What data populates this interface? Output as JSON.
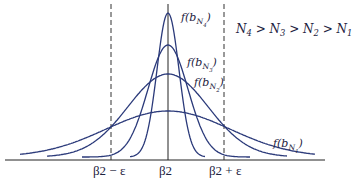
{
  "figure": {
    "relation_text": "N4 > N3 > N2 > N1",
    "colors": {
      "curve": "#2b3a7a",
      "axis": "#222222",
      "dashed": "#333333",
      "text": "#1d2240"
    },
    "axis": {
      "ticks": [
        {
          "id": "minus",
          "label": "β2 − ε",
          "x": 111
        },
        {
          "id": "center",
          "label": "β2",
          "x": 168
        },
        {
          "id": "plus",
          "label": "β2 + ε",
          "x": 224
        }
      ]
    },
    "curves": [
      {
        "name": "N4",
        "label": "f(bN4)",
        "peak_y": 16,
        "sigma": 11,
        "x_from": 130,
        "x_to": 205,
        "label_x": 181,
        "label_y": 11
      },
      {
        "name": "N3",
        "label": "f(bN3)",
        "peak_y": 48,
        "sigma": 20,
        "x_from": 82,
        "x_to": 250,
        "label_x": 187,
        "label_y": 56
      },
      {
        "name": "N2",
        "label": "f(bN2)",
        "peak_y": 77,
        "sigma": 40,
        "x_from": 47,
        "x_to": 287,
        "label_x": 194,
        "label_y": 76
      },
      {
        "name": "N1",
        "label": "f(bN1)",
        "peak_y": 114,
        "sigma": 62,
        "x_from": 20,
        "x_to": 315,
        "label_x": 273,
        "label_y": 137
      }
    ]
  },
  "chart_data": {
    "type": "line",
    "title": "",
    "xlabel": "",
    "ylabel": "",
    "x_ticks": [
      "β2 − ε",
      "β2",
      "β2 + ε"
    ],
    "legend_note": "N4 > N3 > N2 > N1",
    "series": [
      {
        "name": "f(b_N4)",
        "shape": "normal",
        "relative_peak": 1.0,
        "relative_spread": 0.18
      },
      {
        "name": "f(b_N3)",
        "shape": "normal",
        "relative_peak": 0.78,
        "relative_spread": 0.32
      },
      {
        "name": "f(b_N2)",
        "shape": "normal",
        "relative_peak": 0.57,
        "relative_spread": 0.64
      },
      {
        "name": "f(b_N1)",
        "shape": "normal",
        "relative_peak": 0.32,
        "relative_spread": 1.0
      }
    ],
    "vertical_lines": [
      {
        "label": "β2 − ε",
        "style": "dashed"
      },
      {
        "label": "β2",
        "style": "solid"
      },
      {
        "label": "β2 + ε",
        "style": "dashed"
      }
    ],
    "grid": false
  }
}
